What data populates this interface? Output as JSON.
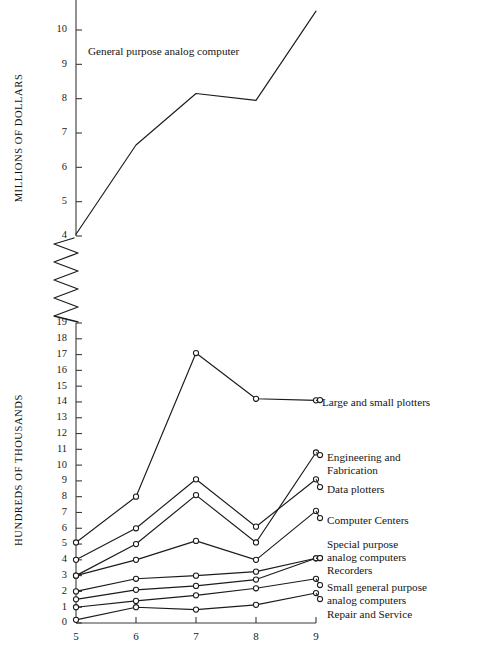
{
  "figure": {
    "background": "#ffffff",
    "ink": "#1b1b1b"
  },
  "upper_axis": {
    "title": "MILLIONS OF DOLLARS",
    "ticks": [
      "10",
      "9",
      "8",
      "7",
      "6",
      "5",
      "4"
    ],
    "break_symbol": "zigzag"
  },
  "lower_axis": {
    "title": "HUNDREDS OF THOUSANDS",
    "ticks": [
      "19",
      "18",
      "17",
      "16",
      "15",
      "14",
      "13",
      "12",
      "11",
      "10",
      "9",
      "8",
      "7",
      "6",
      "5",
      "4",
      "3",
      "2",
      "1",
      "0"
    ]
  },
  "x_axis": {
    "ticks": [
      "5",
      "6",
      "7",
      "8",
      "9"
    ]
  },
  "annotations": {
    "upper_series_label": "General purpose analog computer"
  },
  "series_labels": {
    "large_small_plotters": "Large and small plotters",
    "engineering_fabrication_1": "Engineering and",
    "engineering_fabrication_2": "Fabrication",
    "data_plotters": "Data plotters",
    "computer_centers": "Computer Centers",
    "special_purpose_1": "Special purpose",
    "special_purpose_2": "analog computers",
    "recorders": "Recorders",
    "small_general_1": "Small general purpose",
    "small_general_2": "analog computers",
    "repair_service": "Repair and Service"
  },
  "chart_data": [
    {
      "type": "line",
      "id": "upper-panel",
      "title": "",
      "xlabel": "",
      "ylabel": "MILLIONS OF DOLLARS",
      "x": [
        5,
        6,
        7,
        8,
        9
      ],
      "xlim": [
        5,
        9
      ],
      "ylim": [
        4,
        10.8
      ],
      "yticks": [
        4,
        5,
        6,
        7,
        8,
        9,
        10
      ],
      "grid": false,
      "legend": "inline-annotation",
      "axis_break": true,
      "series": [
        {
          "name": "General purpose analog computer",
          "values": [
            4.05,
            6.65,
            8.15,
            7.95,
            10.55
          ],
          "markers": false
        }
      ]
    },
    {
      "type": "line",
      "id": "lower-panel",
      "title": "",
      "xlabel": "",
      "ylabel": "HUNDREDS OF THOUSANDS",
      "x": [
        5,
        6,
        7,
        8,
        9
      ],
      "xlim": [
        5,
        9
      ],
      "ylim": [
        0,
        19
      ],
      "yticks": [
        0,
        1,
        2,
        3,
        4,
        5,
        6,
        7,
        8,
        9,
        10,
        11,
        12,
        13,
        14,
        15,
        16,
        17,
        18,
        19
      ],
      "grid": false,
      "legend": "right-side-labels",
      "series": [
        {
          "name": "Large and small plotters",
          "values": [
            5.1,
            8.0,
            17.1,
            14.2,
            14.1
          ],
          "markers": true
        },
        {
          "name": "Engineering and Fabrication",
          "values": [
            3.0,
            5.0,
            8.1,
            5.1,
            10.8
          ],
          "markers": true
        },
        {
          "name": "Data plotters",
          "values": [
            4.0,
            6.0,
            9.1,
            6.1,
            9.1
          ],
          "markers": true
        },
        {
          "name": "Computer Centers",
          "values": [
            3.0,
            4.0,
            5.2,
            4.0,
            7.1
          ],
          "markers": true
        },
        {
          "name": "Special purpose analog computers",
          "values": [
            2.0,
            2.8,
            3.0,
            3.25,
            4.1
          ],
          "markers": true
        },
        {
          "name": "Recorders",
          "values": [
            1.5,
            2.1,
            2.35,
            2.75,
            4.1
          ],
          "markers": true
        },
        {
          "name": "Small general purpose analog computers",
          "values": [
            1.0,
            1.4,
            1.75,
            2.2,
            2.8
          ],
          "markers": true
        },
        {
          "name": "Repair and Service",
          "values": [
            0.2,
            1.0,
            0.85,
            1.15,
            1.9
          ],
          "markers": true
        }
      ]
    }
  ]
}
